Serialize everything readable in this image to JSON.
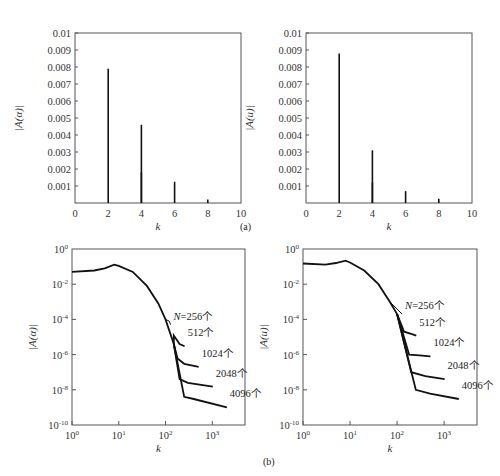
{
  "figure": {
    "caption_a": "(a)",
    "caption_b": "(b)"
  },
  "chart_data": [
    {
      "id": "a-left",
      "type": "bar",
      "panel": "(a) left",
      "title": "",
      "xlabel": "k",
      "ylabel": "|A(α)|",
      "xlim": [
        0,
        10
      ],
      "ylim": [
        0,
        0.01
      ],
      "xticks": [
        "0",
        "2",
        "4",
        "6",
        "8",
        "10"
      ],
      "yticks": [
        "0.001",
        "0.002",
        "0.003",
        "0.004",
        "0.005",
        "0.006",
        "0.007",
        "0.008",
        "0.009",
        "0.01"
      ],
      "grid": false,
      "stems": [
        {
          "k": 2,
          "value": 0.0079
        },
        {
          "k": 4,
          "value": 0.0046
        },
        {
          "k": 4,
          "value": 0.0018
        },
        {
          "k": 6,
          "value": 0.00125
        },
        {
          "k": 8,
          "value": 0.0002
        }
      ]
    },
    {
      "id": "a-right",
      "type": "bar",
      "panel": "(a) right",
      "title": "",
      "xlabel": "k",
      "ylabel": "|A(u)|",
      "xlim": [
        0,
        10
      ],
      "ylim": [
        0,
        0.01
      ],
      "xticks": [
        "0",
        "2",
        "4",
        "6",
        "8",
        "10"
      ],
      "yticks": [
        "0.001",
        "0.002",
        "0.003",
        "0.004",
        "0.005",
        "0.006",
        "0.007",
        "0.008",
        "0.009",
        "0.01"
      ],
      "grid": false,
      "stems": [
        {
          "k": 2,
          "value": 0.0088
        },
        {
          "k": 4,
          "value": 0.0031
        },
        {
          "k": 4,
          "value": 0.0012
        },
        {
          "k": 6,
          "value": 0.0007
        },
        {
          "k": 8,
          "value": 0.00025
        }
      ]
    },
    {
      "id": "b-left",
      "type": "line",
      "panel": "(b) left",
      "xscale": "log",
      "yscale": "log",
      "xlabel": "k",
      "ylabel": "|A(α)|",
      "xlim": [
        1,
        5000
      ],
      "ylim": [
        1e-10,
        1
      ],
      "xticks": [
        "10^0",
        "10^1",
        "10^2",
        "10^3"
      ],
      "yticks": [
        "10^0",
        "10^-2",
        "10^-4",
        "10^-6",
        "10^-8",
        "10^-10"
      ],
      "grid": false,
      "common_curve": [
        [
          1,
          0.05
        ],
        [
          3,
          0.06
        ],
        [
          5,
          0.08
        ],
        [
          8,
          0.13
        ],
        [
          10,
          0.11
        ],
        [
          20,
          0.05
        ],
        [
          40,
          0.008
        ],
        [
          70,
          0.0008
        ],
        [
          100,
          0.0001
        ],
        [
          150,
          4e-06
        ]
      ],
      "series": [
        {
          "name": "N=256个",
          "label": "N=256个",
          "tail": [
            [
              120,
              8e-05
            ],
            [
              128,
              5e-05
            ]
          ]
        },
        {
          "name": "512个",
          "label": "512个",
          "tail": [
            [
              150,
              1.2e-05
            ],
            [
              200,
              4e-06
            ],
            [
              256,
              3e-06
            ]
          ]
        },
        {
          "name": "1024个",
          "label": "1024个",
          "tail": [
            [
              180,
              6e-07
            ],
            [
              250,
              3e-07
            ],
            [
              512,
              2e-07
            ]
          ]
        },
        {
          "name": "2048个",
          "label": "2048个",
          "tail": [
            [
              200,
              4e-08
            ],
            [
              300,
              2.5e-08
            ],
            [
              1024,
              1.5e-08
            ]
          ]
        },
        {
          "name": "4096个",
          "label": "4096个",
          "tail": [
            [
              250,
              4e-09
            ],
            [
              400,
              3e-09
            ],
            [
              2048,
              1e-09
            ]
          ]
        }
      ]
    },
    {
      "id": "b-right",
      "type": "line",
      "panel": "(b) right",
      "xscale": "log",
      "yscale": "log",
      "xlabel": "k",
      "ylabel": "|A(u)|",
      "xlim": [
        1,
        5000
      ],
      "ylim": [
        1e-10,
        1
      ],
      "xticks": [
        "10^0",
        "10^1",
        "10^2",
        "10^3"
      ],
      "yticks": [
        "10^0",
        "10^-2",
        "10^-4",
        "10^-6",
        "10^-8",
        "10^-10"
      ],
      "grid": false,
      "common_curve": [
        [
          1,
          0.15
        ],
        [
          3,
          0.13
        ],
        [
          5,
          0.16
        ],
        [
          8,
          0.22
        ],
        [
          10,
          0.17
        ],
        [
          20,
          0.06
        ],
        [
          40,
          0.01
        ],
        [
          70,
          0.001
        ],
        [
          100,
          0.0002
        ]
      ],
      "series": [
        {
          "name": "N=256个",
          "label": "N=256个",
          "tail": [
            [
              110,
              0.0003
            ],
            [
              128,
              0.0002
            ]
          ]
        },
        {
          "name": "512个",
          "label": "512个",
          "tail": [
            [
              140,
              2e-05
            ],
            [
              200,
              1.5e-05
            ],
            [
              256,
              1.2e-05
            ]
          ]
        },
        {
          "name": "1024个",
          "label": "1024个",
          "tail": [
            [
              180,
              1e-06
            ],
            [
              300,
              9e-07
            ],
            [
              512,
              8e-07
            ]
          ]
        },
        {
          "name": "2048个",
          "label": "2048个",
          "tail": [
            [
              200,
              1e-07
            ],
            [
              400,
              6e-08
            ],
            [
              1024,
              4e-08
            ]
          ]
        },
        {
          "name": "4096个",
          "label": "4096个",
          "tail": [
            [
              250,
              1e-08
            ],
            [
              500,
              6e-09
            ],
            [
              2048,
              3e-09
            ]
          ]
        }
      ]
    }
  ]
}
